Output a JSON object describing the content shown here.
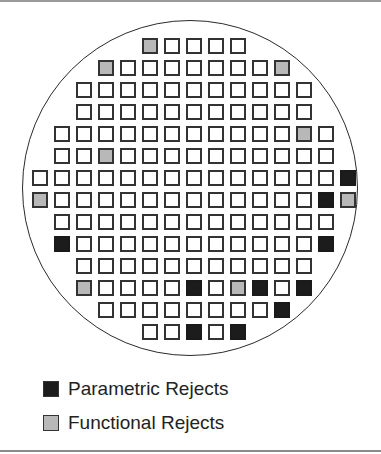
{
  "figure": {
    "type": "wafer-map",
    "rows": [
      {
        "start_col": 5,
        "cells": [
          "F",
          "",
          "",
          "",
          ""
        ]
      },
      {
        "start_col": 3,
        "cells": [
          "F",
          "",
          "",
          "",
          "",
          "",
          "",
          "",
          "F"
        ]
      },
      {
        "start_col": 2,
        "cells": [
          "",
          "",
          "",
          "",
          "",
          "",
          "",
          "",
          "",
          "",
          ""
        ]
      },
      {
        "start_col": 2,
        "cells": [
          "",
          "",
          "",
          "",
          "",
          "",
          "",
          "",
          "",
          "",
          ""
        ]
      },
      {
        "start_col": 1,
        "cells": [
          "",
          "",
          "",
          "",
          "",
          "",
          "",
          "",
          "",
          "",
          "",
          "F",
          ""
        ]
      },
      {
        "start_col": 1,
        "cells": [
          "",
          "",
          "F",
          "",
          "",
          "",
          "",
          "",
          "",
          "",
          "",
          "",
          ""
        ]
      },
      {
        "start_col": 0,
        "cells": [
          "",
          "",
          "",
          "",
          "",
          "",
          "",
          "",
          "",
          "",
          "",
          "",
          "",
          "",
          "P"
        ]
      },
      {
        "start_col": 0,
        "cells": [
          "F",
          "",
          "",
          "",
          "",
          "",
          "",
          "",
          "",
          "",
          "",
          "",
          "",
          "P",
          "F"
        ]
      },
      {
        "start_col": 1,
        "cells": [
          "",
          "",
          "",
          "",
          "",
          "",
          "",
          "",
          "",
          "",
          "",
          "",
          ""
        ]
      },
      {
        "start_col": 1,
        "cells": [
          "P",
          "",
          "",
          "",
          "",
          "",
          "",
          "",
          "",
          "",
          "",
          "",
          "P"
        ]
      },
      {
        "start_col": 2,
        "cells": [
          "",
          "",
          "",
          "",
          "",
          "",
          "",
          "",
          "",
          "",
          ""
        ]
      },
      {
        "start_col": 2,
        "cells": [
          "F",
          "",
          "",
          "",
          "",
          "P",
          "",
          "F",
          "P",
          "",
          "P"
        ]
      },
      {
        "start_col": 3,
        "cells": [
          "",
          "",
          "",
          "",
          "",
          "",
          "",
          "",
          "P"
        ]
      },
      {
        "start_col": 5,
        "cells": [
          "",
          "",
          "P",
          "",
          "P"
        ]
      }
    ],
    "colors": {
      "parametric": "#1c1c1c",
      "functional": "#b8b8b8",
      "good": "#ffffff"
    }
  },
  "legend": {
    "items": [
      {
        "key": "P",
        "label": "Parametric Rejects"
      },
      {
        "key": "F",
        "label": "Functional Rejects"
      }
    ]
  }
}
